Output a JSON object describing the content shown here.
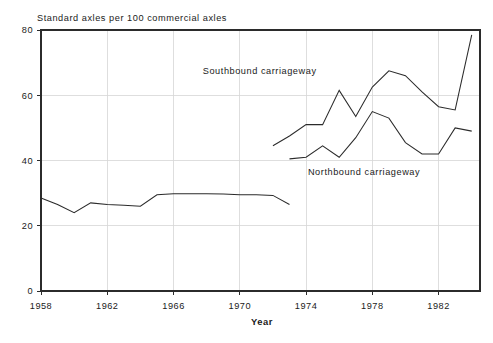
{
  "chart_data": {
    "type": "line",
    "title": "Standard axles per 100 commercial axles",
    "xlabel": "Year",
    "ylabel": "",
    "xlim": [
      1958,
      1984.5
    ],
    "ylim": [
      0,
      80
    ],
    "grid": true,
    "legend_position": "inline-annotation",
    "x_ticks": [
      1958,
      1962,
      1966,
      1970,
      1974,
      1978,
      1982
    ],
    "x_tick_labels": [
      "1958",
      "1962",
      "1966",
      "1970",
      "1974",
      "1978",
      "1982"
    ],
    "y_ticks": [
      0,
      20,
      40,
      60,
      80
    ],
    "y_tick_labels": [
      "0",
      "20",
      "40",
      "60",
      "80"
    ],
    "annotations": [
      {
        "text": "Southbound carriageway",
        "x": 1971.2,
        "y": 66.5
      },
      {
        "text": "Northbound carriageway",
        "x": 1977.5,
        "y": 35.5
      }
    ],
    "series": [
      {
        "name": "Combined carriageway",
        "x": [
          1958,
          1959,
          1960,
          1961,
          1962,
          1963,
          1964,
          1965,
          1966,
          1967,
          1968,
          1969,
          1970,
          1971,
          1972,
          1973
        ],
        "values": [
          28.5,
          26.5,
          24.0,
          27.0,
          26.5,
          26.3,
          26.0,
          29.5,
          29.8,
          29.8,
          29.8,
          29.7,
          29.5,
          29.5,
          29.3,
          26.5
        ]
      },
      {
        "name": "Southbound carriageway",
        "x": [
          1972,
          1973,
          1974,
          1975,
          1976,
          1977,
          1978,
          1979,
          1980,
          1981,
          1982,
          1983,
          1984
        ],
        "values": [
          44.5,
          47.5,
          51.0,
          51.0,
          61.5,
          53.5,
          62.5,
          67.5,
          66.0,
          61.0,
          56.5,
          55.5,
          78.5
        ]
      },
      {
        "name": "Northbound carriageway",
        "x": [
          1973,
          1974,
          1975,
          1976,
          1977,
          1978,
          1979,
          1980,
          1981,
          1982,
          1983,
          1984
        ],
        "values": [
          40.5,
          41.0,
          44.5,
          41.0,
          47.0,
          55.0,
          53.0,
          45.5,
          42.0,
          42.0,
          50.0,
          49.0
        ]
      }
    ]
  },
  "axis_titles": {
    "x": "Year"
  }
}
